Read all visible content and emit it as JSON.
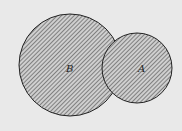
{
  "diagram": {
    "type": "venn-circles",
    "background": "#e9e9e9",
    "hatch_color": "#555555",
    "circles": [
      {
        "label": "B",
        "cx": 70,
        "cy": 65,
        "r": 51
      },
      {
        "label": "A",
        "cx": 137,
        "cy": 68,
        "r": 35
      }
    ]
  }
}
